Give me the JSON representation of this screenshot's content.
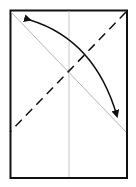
{
  "diagram": {
    "type": "origami-fold-step",
    "paper": {
      "x": 10,
      "y": 10,
      "width": 117,
      "height": 168,
      "stroke": "#111111",
      "fill": "#ffffff"
    },
    "guides": {
      "center_vertical": {
        "x1": 69,
        "y1": 11,
        "x2": 69,
        "y2": 177,
        "color": "#c8c8c8"
      },
      "diagonal_crease": {
        "x1": 11,
        "y1": 12,
        "x2": 126,
        "y2": 132,
        "color": "#b4b4b4"
      }
    },
    "valley_fold_line": {
      "x1": 126,
      "y1": 12,
      "x2": 10,
      "y2": 132,
      "color": "#111111",
      "dash": "9 6"
    },
    "fold_arrow": {
      "from": [
        28,
        19
      ],
      "to": [
        118,
        119
      ],
      "color": "#111111",
      "direction": "bidirectional"
    }
  }
}
